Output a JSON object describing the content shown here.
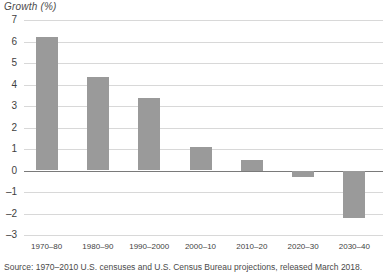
{
  "axis_title": "Growth (%)",
  "source_note": "Source: 1970–2010 U.S. censuses and U.S. Census Bureau projections, released March 2018.",
  "colors": {
    "bar_fill": "#9a9a9a",
    "gridline": "#d8d8d8",
    "zero_line": "#7a7a7a",
    "text": "#3f3f3f",
    "background": "#ffffff"
  },
  "chart_data": {
    "type": "bar",
    "title": "",
    "subtitle": "",
    "xlabel": "",
    "ylabel": "Growth (%)",
    "categories": [
      "1970–80",
      "1980–90",
      "1990–2000",
      "2000–10",
      "2010–20",
      "2020–30",
      "2030–40"
    ],
    "values": [
      6.2,
      4.35,
      3.35,
      1.1,
      0.5,
      -0.3,
      -2.2
    ],
    "ylim": [
      -3,
      7
    ],
    "ytick_labels": [
      "7",
      "6",
      "5",
      "4",
      "3",
      "2",
      "1",
      "0",
      "–1",
      "–2",
      "–3"
    ],
    "ytick_values": [
      7,
      6,
      5,
      4,
      3,
      2,
      1,
      0,
      -1,
      -2,
      -3
    ],
    "grid": true,
    "legend": "none",
    "series": [
      {
        "name": "Growth (%)",
        "values": [
          6.2,
          4.35,
          3.35,
          1.1,
          0.5,
          -0.3,
          -2.2
        ]
      }
    ]
  }
}
